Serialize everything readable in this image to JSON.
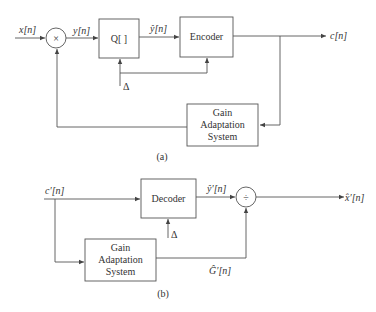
{
  "diagram_a": {
    "caption": "(a)",
    "input_label": "x[n]",
    "multiplier_symbol": "×",
    "multiplier_output_label": "y[n]",
    "quantizer_label": "Q[ ]",
    "quantizer_output_label": "ŷ[n]",
    "encoder_label": "Encoder",
    "output_label": "c[n]",
    "step_label": "Δ",
    "gain_block_lines": [
      "Gain",
      "Adaptation",
      "System"
    ]
  },
  "diagram_b": {
    "caption": "(b)",
    "input_label": "c′[n]",
    "decoder_label": "Decoder",
    "decoder_output_label": "ŷ′[n]",
    "step_label": "Δ",
    "divider_symbol": "÷",
    "output_label": "x̂′[n]",
    "gain_output_label": "Ĝ′[n]",
    "gain_block_lines": [
      "Gain",
      "Adaptation",
      "System"
    ]
  },
  "colors": {
    "line": "#555555",
    "text": "#333333",
    "background": "#ffffff"
  }
}
